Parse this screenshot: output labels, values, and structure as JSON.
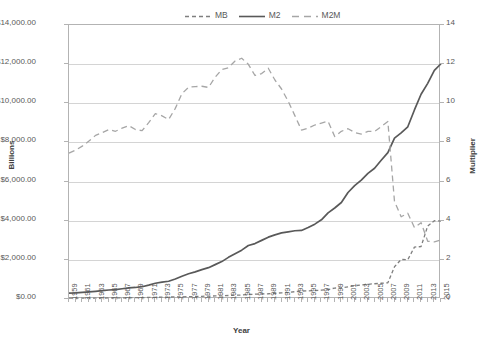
{
  "chart_data": {
    "type": "line",
    "title": "",
    "xlabel": "Year",
    "ylabel": "Billions",
    "y2label": "Multiplier",
    "grid": true,
    "legend_position": "top-center",
    "xlim": [
      1959,
      2015
    ],
    "ylim": [
      0,
      14000
    ],
    "y2lim": [
      0,
      14
    ],
    "y_tick_labels": [
      "$14,000.00",
      "$12,000.00",
      "$10,000.00",
      "$8,000.00",
      "$6,000.00",
      "$4,000.00",
      "$2,000.00",
      "$0.00"
    ],
    "y_tick_values": [
      14000,
      12000,
      10000,
      8000,
      6000,
      4000,
      2000,
      0
    ],
    "y2_tick_labels": [
      "14",
      "12",
      "10",
      "8",
      "6",
      "4",
      "2",
      "0"
    ],
    "y2_tick_values": [
      14,
      12,
      10,
      8,
      6,
      4,
      2,
      0
    ],
    "x_tick_labels": [
      "1959",
      "1961",
      "1963",
      "1965",
      "1967",
      "1969",
      "1971",
      "1973",
      "1975",
      "1977",
      "1979",
      "1981",
      "1983",
      "1985",
      "1987",
      "1989",
      "1991",
      "1993",
      "1995",
      "1997",
      "1999",
      "2001",
      "2003",
      "2005",
      "2007",
      "2009",
      "2011",
      "2013",
      "2015"
    ],
    "x": [
      1959,
      1960,
      1961,
      1962,
      1963,
      1964,
      1965,
      1966,
      1967,
      1968,
      1969,
      1970,
      1971,
      1972,
      1973,
      1974,
      1975,
      1976,
      1977,
      1978,
      1979,
      1980,
      1981,
      1982,
      1983,
      1984,
      1985,
      1986,
      1987,
      1988,
      1989,
      1990,
      1991,
      1992,
      1993,
      1994,
      1995,
      1996,
      1997,
      1998,
      1999,
      2000,
      2001,
      2002,
      2003,
      2004,
      2005,
      2006,
      2007,
      2008,
      2009,
      2010,
      2011,
      2012,
      2013,
      2014,
      2015
    ],
    "series": [
      {
        "name": "MB",
        "axis": "left",
        "units": "Billions",
        "style": "dashed",
        "color": "#7f7f7f",
        "values": [
          40,
          41,
          43,
          45,
          47,
          50,
          53,
          56,
          60,
          64,
          68,
          73,
          79,
          85,
          92,
          99,
          105,
          111,
          119,
          128,
          138,
          148,
          155,
          163,
          180,
          190,
          203,
          228,
          248,
          260,
          268,
          293,
          315,
          340,
          372,
          406,
          418,
          430,
          450,
          485,
          560,
          575,
          625,
          680,
          720,
          750,
          780,
          805,
          825,
          1650,
          2020,
          2010,
          2650,
          2680,
          3730,
          4000,
          3980
        ]
      },
      {
        "name": "M2",
        "axis": "left",
        "units": "Billions",
        "style": "solid",
        "color": "#595959",
        "values": [
          298,
          312,
          336,
          363,
          393,
          425,
          459,
          480,
          524,
          567,
          589,
          628,
          712,
          805,
          861,
          908,
          1023,
          1164,
          1287,
          1389,
          1500,
          1600,
          1756,
          1911,
          2127,
          2311,
          2497,
          2734,
          2832,
          2995,
          3159,
          3279,
          3379,
          3434,
          3487,
          3502,
          3650,
          3824,
          4046,
          4402,
          4650,
          4930,
          5440,
          5790,
          6070,
          6420,
          6680,
          7090,
          7480,
          8220,
          8490,
          8800,
          9660,
          10460,
          11020,
          11680,
          12020
        ]
      },
      {
        "name": "M2M",
        "axis": "right",
        "units": "Multiplier",
        "style": "dashed-long",
        "color": "#a6a6a6",
        "values": [
          7.45,
          7.61,
          7.81,
          8.07,
          8.36,
          8.5,
          8.66,
          8.57,
          8.73,
          8.86,
          8.66,
          8.6,
          9.01,
          9.47,
          9.36,
          9.17,
          9.74,
          10.49,
          10.82,
          10.85,
          10.87,
          10.81,
          11.33,
          11.72,
          11.82,
          12.16,
          12.3,
          11.99,
          11.42,
          11.52,
          11.79,
          11.19,
          10.73,
          10.1,
          9.37,
          8.63,
          8.73,
          8.89,
          8.99,
          9.08,
          8.3,
          8.57,
          8.7,
          8.51,
          8.43,
          8.56,
          8.56,
          8.81,
          9.07,
          4.98,
          4.2,
          4.38,
          3.65,
          3.9,
          2.95,
          2.92,
          3.02
        ]
      }
    ]
  },
  "legend": {
    "items": [
      {
        "label": "MB",
        "style": "dashed"
      },
      {
        "label": "M2",
        "style": "solid"
      },
      {
        "label": "M2M",
        "style": "dashed-long"
      }
    ]
  },
  "axes": {
    "x_title": "Year",
    "y_left_title": "Billions",
    "y_right_title": "Multiplier"
  }
}
